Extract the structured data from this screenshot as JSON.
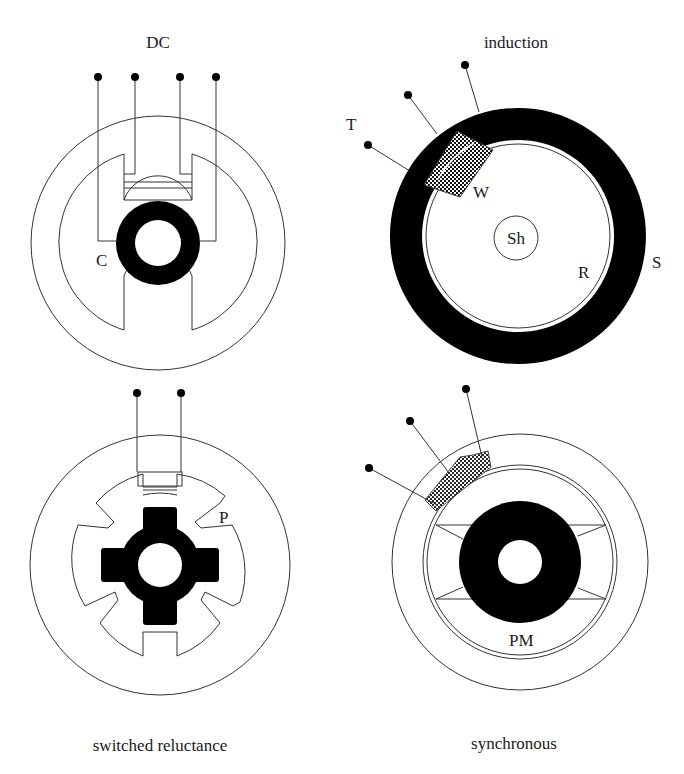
{
  "figure": {
    "panels": [
      {
        "id": "dc",
        "title": "DC",
        "labels": [
          "C"
        ],
        "terminals": 4
      },
      {
        "id": "induction",
        "title": "induction",
        "labels": [
          "T",
          "W",
          "Sh",
          "R",
          "S"
        ],
        "terminals": 3
      },
      {
        "id": "switched-reluctance",
        "title": "switched reluctance",
        "labels": [
          "P"
        ],
        "terminals": 2
      },
      {
        "id": "synchronous",
        "title": "synchronous",
        "labels": [
          "PM"
        ],
        "terminals": 3
      }
    ]
  },
  "dc": {
    "title": "DC",
    "label_c": "C"
  },
  "induction": {
    "title": "induction",
    "label_t": "T",
    "label_w": "W",
    "label_sh": "Sh",
    "label_r": "R",
    "label_s": "S"
  },
  "sr": {
    "title": "switched reluctance",
    "label_p": "P"
  },
  "sync": {
    "title": "synchronous",
    "label_pm": "PM"
  },
  "colors": {
    "line": "#333333",
    "fill": "#000000",
    "background": "#ffffff"
  }
}
